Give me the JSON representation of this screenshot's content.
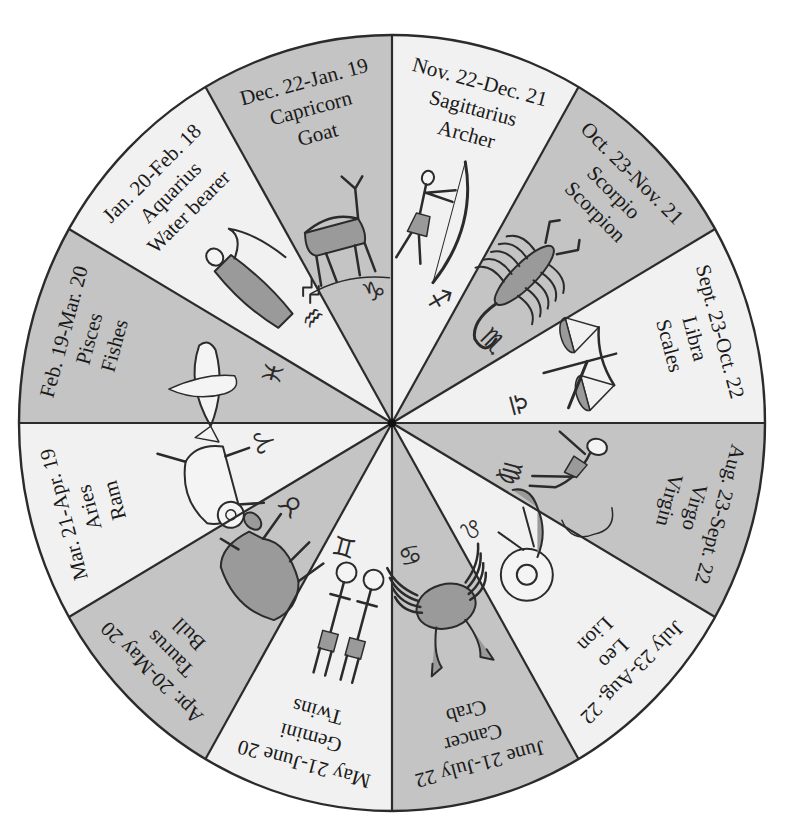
{
  "diagram": {
    "center": [
      392,
      423
    ],
    "radius_x": 373,
    "radius_y": 388,
    "colors": {
      "light_segment": "#f1f1f1",
      "dark_segment": "#c4c4c4",
      "outline": "#2b2b2b",
      "figure_fill": "#9a9a9a",
      "figure_light": "#f4f4f4",
      "text": "#1a1a1a"
    },
    "segments": [
      {
        "sign": "Sagittarius",
        "meaning": "Archer",
        "dates": "Nov. 22-Dec. 21",
        "symbol": "♐",
        "shade": "light",
        "figure": "archer"
      },
      {
        "sign": "Scorpio",
        "meaning": "Scorpion",
        "dates": "Oct. 23-Nov. 21",
        "symbol": "♏",
        "shade": "dark",
        "figure": "scorpion"
      },
      {
        "sign": "Libra",
        "meaning": "Scales",
        "dates": "Sept. 23-Oct. 22",
        "symbol": "♎",
        "shade": "light",
        "figure": "scales"
      },
      {
        "sign": "Virgo",
        "meaning": "Virgin",
        "dates": "Aug. 23-Sept. 22",
        "symbol": "♍",
        "shade": "dark",
        "figure": "virgin"
      },
      {
        "sign": "Leo",
        "meaning": "Lion",
        "dates": "July 23-Aug. 22",
        "symbol": "♌",
        "shade": "light",
        "figure": "lion"
      },
      {
        "sign": "Cancer",
        "meaning": "Crab",
        "dates": "June 21-July 22",
        "symbol": "♋",
        "shade": "dark",
        "figure": "crab"
      },
      {
        "sign": "Gemini",
        "meaning": "Twins",
        "dates": "May 21-June 20",
        "symbol": "♊",
        "shade": "light",
        "figure": "twins"
      },
      {
        "sign": "Taurus",
        "meaning": "Bull",
        "dates": "Apr. 20-May 20",
        "symbol": "♉",
        "shade": "dark",
        "figure": "bull"
      },
      {
        "sign": "Aries",
        "meaning": "Ram",
        "dates": "Mar. 21-Apr. 19",
        "symbol": "♈",
        "shade": "light",
        "figure": "ram"
      },
      {
        "sign": "Pisces",
        "meaning": "Fishes",
        "dates": "Feb. 19-Mar. 20",
        "symbol": "♓",
        "shade": "dark",
        "figure": "fishes"
      },
      {
        "sign": "Aquarius",
        "meaning": "Water bearer",
        "dates": "Jan. 20-Feb. 18",
        "symbol": "♒",
        "shade": "light",
        "figure": "water-bearer"
      },
      {
        "sign": "Capricorn",
        "meaning": "Goat",
        "dates": "Dec. 22-Jan. 19",
        "symbol": "♑",
        "shade": "dark",
        "figure": "goat"
      }
    ]
  }
}
